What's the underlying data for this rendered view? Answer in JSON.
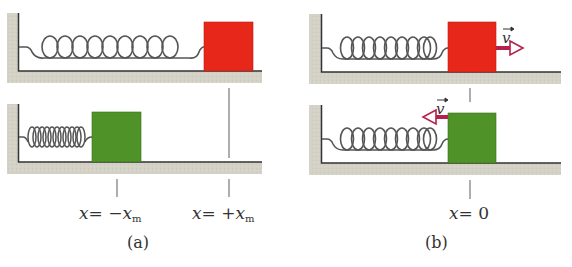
{
  "figure": {
    "panels": [
      {
        "id": "a",
        "caption": "(a)",
        "scenes": [
          {
            "block_color": "#e8271b",
            "block_state": "stretched",
            "velocity": null
          },
          {
            "block_color": "#4f9227",
            "block_state": "compressed",
            "velocity": null
          }
        ],
        "markers": [
          {
            "var": "x",
            "equals": "=",
            "sign": "−",
            "symbol": "x",
            "subscript": "m"
          },
          {
            "var": "x",
            "equals": "=",
            "sign": "+",
            "symbol": "x",
            "subscript": "m"
          }
        ]
      },
      {
        "id": "b",
        "caption": "(b)",
        "scenes": [
          {
            "block_color": "#e8271b",
            "block_state": "equilibrium",
            "velocity": {
              "label": "v",
              "direction": "right"
            }
          },
          {
            "block_color": "#4f9227",
            "block_state": "equilibrium",
            "velocity": {
              "label": "v",
              "direction": "left"
            }
          }
        ],
        "markers": [
          {
            "var": "x",
            "equals": "=",
            "value": "0"
          }
        ]
      }
    ],
    "colors": {
      "wall_floor": "#d3d1c6",
      "outline": "#333333",
      "spring": "#555555",
      "red_block": "#e8271b",
      "green_block": "#4f9227",
      "velocity_arrow": "#b5214a"
    }
  }
}
